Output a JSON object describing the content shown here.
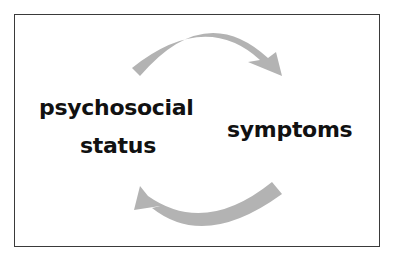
{
  "diagram": {
    "type": "cycle",
    "nodes": [
      {
        "id": "psychosocial",
        "label_line1": "psychosocial",
        "label_line2": "status"
      },
      {
        "id": "symptoms",
        "label": "symptoms"
      }
    ],
    "edges": [
      {
        "from": "psychosocial",
        "to": "symptoms",
        "position": "top"
      },
      {
        "from": "symptoms",
        "to": "psychosocial",
        "position": "bottom"
      }
    ],
    "arrow_color": "#b3b3b3",
    "border_color": "#3a3a3a"
  }
}
